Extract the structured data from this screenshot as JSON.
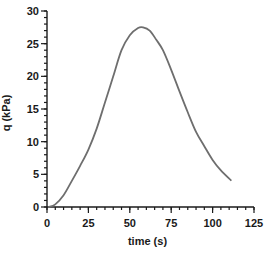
{
  "chart_data": {
    "type": "line",
    "title": "",
    "xlabel": "time (s)",
    "ylabel": "q (kPa)",
    "xlim": [
      0,
      125
    ],
    "ylim": [
      0,
      30
    ],
    "x_ticks": [
      0,
      25,
      50,
      75,
      100,
      125
    ],
    "y_ticks": [
      0,
      5,
      10,
      15,
      20,
      25,
      30
    ],
    "x_minor_step": 5,
    "y_minor_step": 1,
    "grid": false,
    "legend": null,
    "series": [
      {
        "name": "q",
        "color": "#6e6e6e",
        "x": [
          1,
          5,
          10,
          15,
          20,
          25,
          30,
          35,
          40,
          45,
          50,
          55,
          58,
          62,
          66,
          70,
          75,
          80,
          85,
          90,
          95,
          100,
          105,
          111
        ],
        "y": [
          0,
          0.4,
          1.8,
          4.0,
          6.3,
          8.8,
          12.0,
          16.0,
          20.0,
          24.0,
          26.3,
          27.4,
          27.5,
          27.0,
          25.6,
          24.0,
          21.0,
          17.7,
          14.5,
          11.5,
          9.3,
          7.2,
          5.6,
          4.1
        ]
      }
    ]
  }
}
